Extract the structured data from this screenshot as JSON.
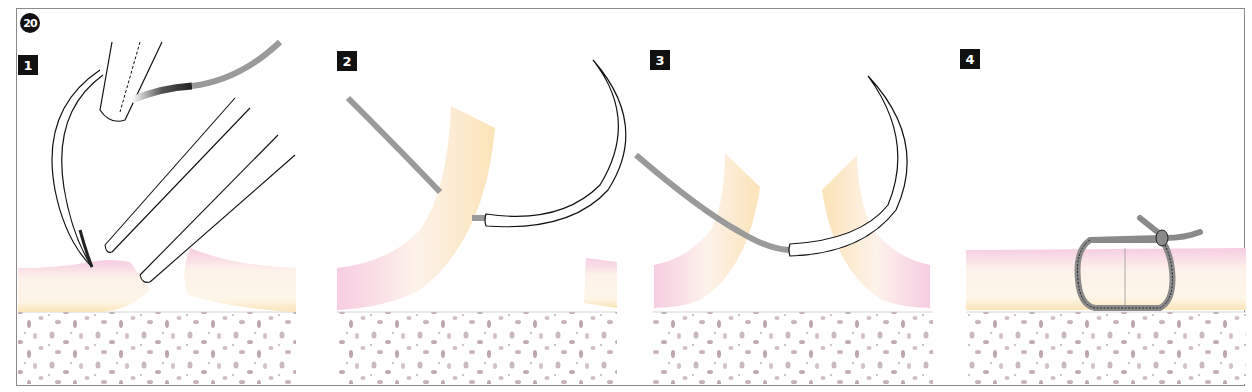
{
  "figure": {
    "number": "20",
    "colors": {
      "frame": "#8a8a8a",
      "label_bg": "#111111",
      "suture": "#9a9a9a",
      "needle_stroke": "#111111",
      "mucosa_pink": "#f3c6dc",
      "mucosa_yellow": "#fbe8c0",
      "tissue_fill": "#fdf3e8",
      "bone_fill": "#ffffff",
      "bone_spots": "#c8b6bd"
    }
  },
  "panels": [
    {
      "label": "1",
      "description": "Needle held in needle holder penetrates the flap while tissue forceps stabilize the wound edge"
    },
    {
      "label": "2",
      "description": "Needle passed through the first flap, suture thread following"
    },
    {
      "label": "3",
      "description": "Needle passed through the opposite flap"
    },
    {
      "label": "4",
      "description": "Suture tied with a surgical knot, wound edges approximated"
    }
  ]
}
